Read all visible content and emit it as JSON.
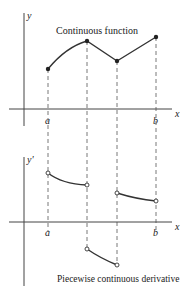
{
  "top_plot": {
    "y_axis_label": "y",
    "x_axis_label": "x",
    "title": "Continuous function",
    "tick_a": "a",
    "tick_b": "b"
  },
  "bottom_plot": {
    "y_axis_label": "y'",
    "x_axis_label": "x",
    "caption": "Piecewise continuous derivative",
    "tick_a": "a",
    "tick_b": "b"
  },
  "colors": {
    "curve": "#333333",
    "axis": "#444444"
  }
}
